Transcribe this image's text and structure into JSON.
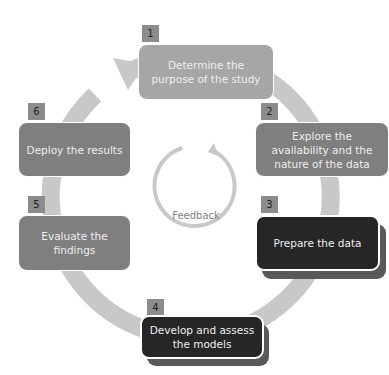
{
  "diagram": {
    "type": "cycle",
    "colors": {
      "ring": "#c8c8c8",
      "feedback_ring": "#c8c8c8",
      "number_badge": "#8c8c8c",
      "light_step": "#a6a6a6",
      "mid_step": "#7f7f7f",
      "dark_step": "#262626",
      "shadow": "#595959"
    },
    "steps": [
      {
        "number": "1",
        "label": "Determine the purpose of the study"
      },
      {
        "number": "2",
        "label": "Explore the availability and the nature of the data"
      },
      {
        "number": "3",
        "label": "Prepare the data"
      },
      {
        "number": "4",
        "label": "Develop and assess the models"
      },
      {
        "number": "5",
        "label": "Evaluate the findings"
      },
      {
        "number": "6",
        "label": "Deploy the results"
      }
    ],
    "feedback": {
      "label": "Feedback"
    }
  }
}
